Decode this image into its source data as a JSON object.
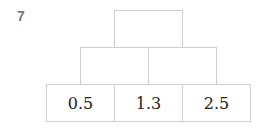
{
  "problem_number": "7",
  "pyramid": {
    "top": [
      ""
    ],
    "middle": [
      "",
      ""
    ],
    "bottom": [
      "0.5",
      "1.3",
      "2.5"
    ]
  }
}
